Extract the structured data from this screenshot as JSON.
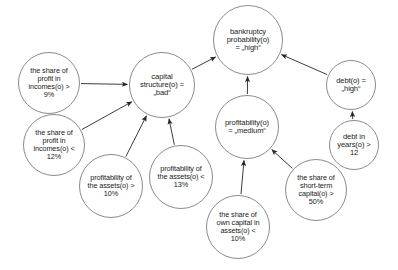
{
  "diagram": {
    "type": "causal-inference-network",
    "background_color": "#ffffff",
    "node_stroke_color": "#8b8b8b",
    "edge_color": "#262626",
    "text_color": "#1b1b1b",
    "nodes": [
      {
        "id": "bankruptcy",
        "label": "bankruptcy\nprobability(o)\n= „high“",
        "cx": 248,
        "cy": 40,
        "r": 35,
        "font_size": 7.6
      },
      {
        "id": "profit-in-incomes-gt-9",
        "label": "the share of\nprofit in\nincomes(o) >\n9%",
        "cx": 49,
        "cy": 83,
        "r": 31,
        "font_size": 7.3
      },
      {
        "id": "capital-structure",
        "label": "capital\nstructure(o) =\n„bad“",
        "cx": 162,
        "cy": 85,
        "r": 33,
        "font_size": 7.6
      },
      {
        "id": "debt-high",
        "label": "debt(o) =\n„high“",
        "cx": 351,
        "cy": 85,
        "r": 25,
        "font_size": 7.6
      },
      {
        "id": "profitability-medium",
        "label": "profitability(o)\n= „medium“",
        "cx": 247,
        "cy": 127,
        "r": 32,
        "font_size": 7.6
      },
      {
        "id": "profit-in-incomes-lt-12",
        "label": "the share of\nprofit in\nincomes(o) <\n12%",
        "cx": 54,
        "cy": 145,
        "r": 31,
        "font_size": 7.3
      },
      {
        "id": "debt-in-years-gt-12",
        "label": "debt in\nyears(o) >\n12",
        "cx": 354,
        "cy": 145,
        "r": 25,
        "font_size": 7.6
      },
      {
        "id": "profitability-assets-gt-10",
        "label": "profitability of\nthe assets(o) >\n10%",
        "cx": 111,
        "cy": 186,
        "r": 32,
        "font_size": 7.3
      },
      {
        "id": "profitability-assets-lt-13",
        "label": "profitability of\nthe assets(o) <\n13%",
        "cx": 181,
        "cy": 177,
        "r": 32,
        "font_size": 7.3
      },
      {
        "id": "short-term-capital-gt-50",
        "label": "the share of\nshort-term\ncapital(o) >\n50%",
        "cx": 316,
        "cy": 190,
        "r": 31,
        "font_size": 7.3
      },
      {
        "id": "own-capital-lt-10",
        "label": "the share of\nown capital in\nassets(o) <\n10%",
        "cx": 238,
        "cy": 227,
        "r": 32,
        "font_size": 7.3
      }
    ],
    "edges": [
      {
        "from": "capital-structure",
        "to": "bankruptcy"
      },
      {
        "from": "profitability-medium",
        "to": "bankruptcy"
      },
      {
        "from": "debt-high",
        "to": "bankruptcy"
      },
      {
        "from": "profit-in-incomes-gt-9",
        "to": "capital-structure"
      },
      {
        "from": "profit-in-incomes-lt-12",
        "to": "capital-structure"
      },
      {
        "from": "profitability-assets-gt-10",
        "to": "capital-structure"
      },
      {
        "from": "profitability-assets-lt-13",
        "to": "capital-structure"
      },
      {
        "from": "own-capital-lt-10",
        "to": "profitability-medium"
      },
      {
        "from": "short-term-capital-gt-50",
        "to": "profitability-medium"
      },
      {
        "from": "debt-in-years-gt-12",
        "to": "debt-high"
      }
    ]
  }
}
